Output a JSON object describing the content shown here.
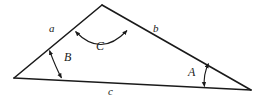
{
  "figure": {
    "type": "triangle-with-labeled-sides-and-angles",
    "background_color": "#ffffff",
    "stroke_color": "#1a1a1a",
    "vertices": {
      "left": {
        "x": 14,
        "y": 78
      },
      "apex": {
        "x": 102,
        "y": 5
      },
      "right": {
        "x": 251,
        "y": 90
      }
    },
    "side_labels": [
      {
        "id": "a",
        "text": "a",
        "x": 49,
        "y": 23,
        "edge": "left-to-apex"
      },
      {
        "id": "b",
        "text": "b",
        "x": 153,
        "y": 23,
        "edge": "apex-to-right"
      },
      {
        "id": "c",
        "text": "c",
        "x": 108,
        "y": 86,
        "edge": "left-to-right"
      }
    ],
    "angle_labels": [
      {
        "id": "A",
        "text": "A",
        "x": 188,
        "y": 66,
        "vertex": "right"
      },
      {
        "id": "B",
        "text": "B",
        "x": 64,
        "y": 51,
        "vertex": "left"
      },
      {
        "id": "C",
        "text": "C",
        "x": 96,
        "y": 40,
        "vertex": "apex"
      }
    ],
    "angle_arcs": [
      {
        "id": "arc-C",
        "label": "C",
        "path": "M 75.5 31.5 Q 101 58 127 30.5"
      },
      {
        "id": "arc-B",
        "label": "B",
        "path": "M 49.5 50.5 Q 56 68 61.5 78"
      },
      {
        "id": "arc-A",
        "label": "A",
        "path": "M 208.5 63.5 Q 203 75 204.5 86.5"
      }
    ]
  }
}
